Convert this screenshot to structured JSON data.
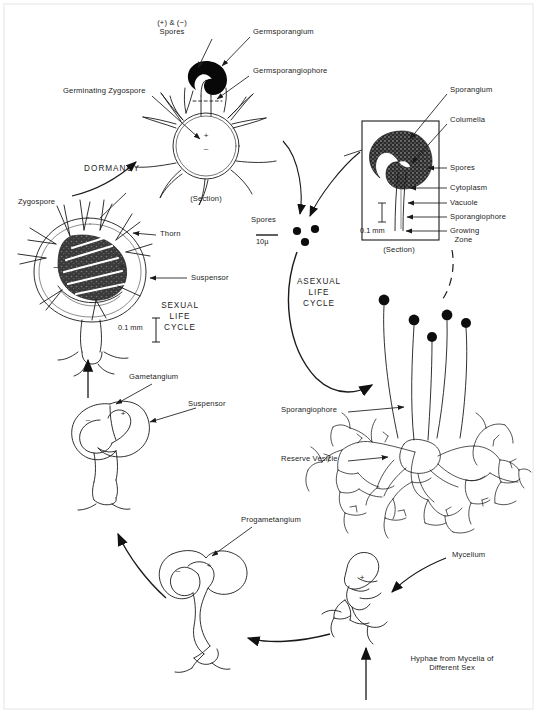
{
  "figure": {
    "background_color": "#ffffff",
    "ink_color": "#1a1a1a"
  },
  "cycles": [
    {
      "name": "sexual-life-cycle",
      "lines": [
        "SEXUAL",
        "LIFE",
        "CYCLE"
      ],
      "x": 180,
      "y": 307
    },
    {
      "name": "asexual-life-cycle",
      "lines": [
        "ASEXUAL",
        "LIFE",
        "CYCLE"
      ],
      "x": 318,
      "y": 283
    }
  ],
  "dormancy": {
    "label": "DORMANCY",
    "x": 100,
    "y": 168
  },
  "labels": [
    {
      "name": "plus-and-minus-spores",
      "text": "(+) & (−)\nSpores",
      "x": 172,
      "y": 22,
      "align": "center"
    },
    {
      "name": "germsporangium",
      "text": "Germsporangium",
      "x": 253,
      "y": 31,
      "align": "left"
    },
    {
      "name": "germsporangiophore",
      "text": "Germsporangiophore",
      "x": 253,
      "y": 70,
      "align": "left"
    },
    {
      "name": "germinating-zygospore",
      "text": "Germinating Zygospore",
      "x": 63,
      "y": 90,
      "align": "left"
    },
    {
      "name": "section-germinating",
      "text": "(Section)",
      "x": 206,
      "y": 200,
      "align": "center"
    },
    {
      "name": "zygospore",
      "text": "Zygospore",
      "x": 18,
      "y": 201,
      "align": "left"
    },
    {
      "name": "thorn",
      "text": "Thorn",
      "x": 159,
      "y": 233,
      "align": "left"
    },
    {
      "name": "suspensor-zygospore",
      "text": "Suspensor",
      "x": 190,
      "y": 276,
      "align": "left"
    },
    {
      "name": "spores",
      "text": "Spores",
      "x": 253,
      "y": 218,
      "align": "left"
    },
    {
      "name": "sporangium",
      "text": "Sporangium",
      "x": 450,
      "y": 89,
      "align": "left"
    },
    {
      "name": "columella",
      "text": "Columella",
      "x": 450,
      "y": 119,
      "align": "left"
    },
    {
      "name": "spores-sporangium",
      "text": "Spores",
      "x": 450,
      "y": 167,
      "align": "left"
    },
    {
      "name": "cytoplasm",
      "text": "Cytoplasm",
      "x": 450,
      "y": 187,
      "align": "left"
    },
    {
      "name": "vacuole",
      "text": "Vacuole",
      "x": 450,
      "y": 202,
      "align": "left"
    },
    {
      "name": "sporangiophore-inset",
      "text": "Sporangiophore",
      "x": 450,
      "y": 216,
      "align": "left"
    },
    {
      "name": "growing-zone",
      "text": "Growing\n  Zone",
      "x": 450,
      "y": 230,
      "align": "left"
    },
    {
      "name": "section-sporangium",
      "text": "(Section)",
      "x": 399,
      "y": 250,
      "align": "center"
    },
    {
      "name": "sporangiophore-mycelium",
      "text": "Sporangiophore",
      "x": 281,
      "y": 409,
      "align": "left"
    },
    {
      "name": "reserve-vesicle",
      "text": "Reserve Vesicle",
      "x": 281,
      "y": 458,
      "align": "left"
    },
    {
      "name": "mycelium",
      "text": "Mycelium",
      "x": 452,
      "y": 554,
      "align": "left"
    },
    {
      "name": "hyphae-different-sex",
      "text": "Hyphae from Mycelia of\nDifferent Sex",
      "x": 452,
      "y": 659,
      "align": "center"
    },
    {
      "name": "progametangium",
      "text": "Progametangium",
      "x": 241,
      "y": 519,
      "align": "left"
    },
    {
      "name": "gametangium",
      "text": "Gametangium",
      "x": 129,
      "y": 376,
      "align": "left"
    },
    {
      "name": "suspensor-gametangium",
      "text": "Suspensor",
      "x": 188,
      "y": 403,
      "align": "left"
    }
  ],
  "scale_bars": [
    {
      "name": "scale-10-micron",
      "text": "10µ",
      "x": 256,
      "y": 242,
      "orientation": "horizontal"
    },
    {
      "name": "scale-0-1-mm-sporangium",
      "text": "0.1 mm",
      "x": 360,
      "y": 230,
      "orientation": "vertical"
    },
    {
      "name": "scale-0-1-mm-zygospore",
      "text": "0.1 mm",
      "x": 118,
      "y": 327,
      "orientation": "vertical"
    }
  ],
  "sign_marks": [
    {
      "name": "plus-germinating-zygospore",
      "text": "+",
      "x": 206,
      "y": 135
    },
    {
      "name": "minus-germinating-zygospore",
      "text": "−",
      "x": 206,
      "y": 148
    },
    {
      "name": "minus-zygospore",
      "text": "−",
      "x": 56,
      "y": 267
    },
    {
      "name": "plus-zygospore",
      "text": "+",
      "x": 122,
      "y": 267
    },
    {
      "name": "minus-gametangium",
      "text": "−",
      "x": 88,
      "y": 419
    },
    {
      "name": "plus-gametangium",
      "text": "+",
      "x": 123,
      "y": 413
    },
    {
      "name": "minus-progametangium",
      "text": "−",
      "x": 178,
      "y": 570
    },
    {
      "name": "plus-progametangium",
      "text": "+",
      "x": 209,
      "y": 565
    },
    {
      "name": "plus-hypha",
      "text": "+",
      "x": 362,
      "y": 576
    }
  ],
  "spore_dots": [
    {
      "name": "spore-dot",
      "cx": 297,
      "cy": 231,
      "r": 4.1
    },
    {
      "name": "spore-dot",
      "cx": 315,
      "cy": 229,
      "r": 4.1
    },
    {
      "name": "spore-dot",
      "cx": 305,
      "cy": 242,
      "r": 4.1
    }
  ],
  "sporangiophore_heads": [
    {
      "name": "sporangium-head",
      "cx": 384,
      "cy": 300,
      "r": 5.4
    },
    {
      "name": "sporangium-head",
      "cx": 414,
      "cy": 320,
      "r": 5.4
    },
    {
      "name": "sporangium-head",
      "cx": 447,
      "cy": 315,
      "r": 5.4
    },
    {
      "name": "sporangium-head",
      "cx": 466,
      "cy": 323,
      "r": 5.0
    },
    {
      "name": "sporangium-head",
      "cx": 432,
      "cy": 337,
      "r": 5.0
    }
  ]
}
